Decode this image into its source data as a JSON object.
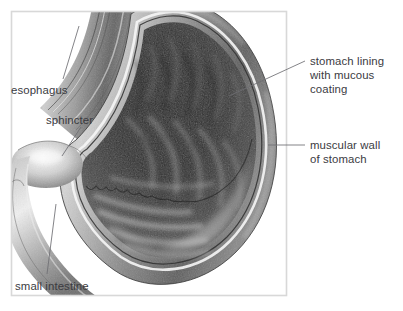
{
  "figure": {
    "type": "anatomical-illustration",
    "style": "grayscale halftone medical illustration with thin outlined frame",
    "frame": {
      "color": "#d8d8d8",
      "x": 11,
      "y": 11,
      "width": 276,
      "height": 285
    },
    "background_color": "#ffffff",
    "text_color": "#3b3b3f",
    "leader_line_color": "#6e6e73"
  },
  "labels": [
    {
      "id": "esophagus",
      "text": "esophagus",
      "side": "left",
      "leader": {
        "from_x": 63,
        "from_y": 79,
        "to_x": 79,
        "to_y": 26
      }
    },
    {
      "id": "sphincter",
      "text": "sphincter",
      "side": "left",
      "leader": {
        "from_x": 62,
        "from_y": 156,
        "to_x": 81,
        "to_y": 127
      }
    },
    {
      "id": "small-intestine",
      "text": "small intestine",
      "side": "left",
      "leader": {
        "from_x": 47,
        "from_y": 274,
        "to_x": 56,
        "to_y": 204
      }
    },
    {
      "id": "stomach-lining",
      "text": "stomach lining\nwith mucous\ncoating",
      "side": "right",
      "leader": {
        "from_x": 305,
        "from_y": 61,
        "to_x": 229,
        "to_y": 96
      }
    },
    {
      "id": "muscular-wall",
      "text": "muscular wall\nof stomach",
      "side": "right",
      "leader": {
        "from_x": 305,
        "from_y": 145,
        "to_x": 268,
        "to_y": 145
      }
    }
  ],
  "anatomy_parts": [
    {
      "id": "esophagus-tube",
      "name": "esophagus"
    },
    {
      "id": "cardiac-sphincter",
      "name": "sphincter"
    },
    {
      "id": "stomach-body",
      "name": "stomach body with rugae folds"
    },
    {
      "id": "mucosal-lining",
      "name": "stomach lining with mucous coating"
    },
    {
      "id": "muscular-wall",
      "name": "muscular wall of stomach"
    },
    {
      "id": "duodenum",
      "name": "small intestine"
    }
  ]
}
